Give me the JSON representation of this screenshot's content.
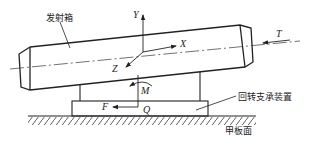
{
  "diagram": {
    "labels": {
      "launcher_box": "发射箱",
      "slewing_support": "回转支承装置",
      "deck_surface": "甲板面"
    },
    "axes": {
      "x": "X",
      "y": "Y",
      "z": "Z"
    },
    "forces": {
      "thrust": "T",
      "moment": "M",
      "horizontal_force": "F",
      "vertical_load": "Q"
    },
    "colors": {
      "line": "#222222",
      "background": "#ffffff"
    }
  }
}
